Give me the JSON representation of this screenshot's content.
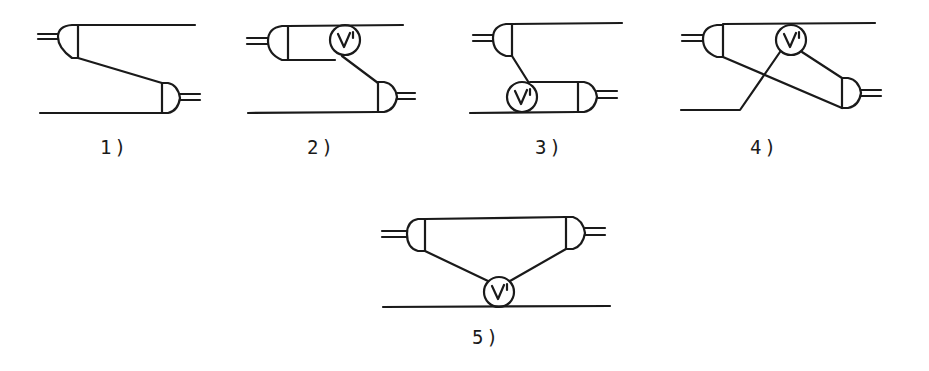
{
  "diagrams": [
    {
      "id": 1,
      "label": "1)",
      "has_voltmeter": false
    },
    {
      "id": 2,
      "label": "2)",
      "has_voltmeter": true,
      "voltmeter_label": "V'"
    },
    {
      "id": 3,
      "label": "3)",
      "has_voltmeter": true,
      "voltmeter_label": "V'"
    },
    {
      "id": 4,
      "label": "4)",
      "has_voltmeter": true,
      "voltmeter_label": "V'"
    },
    {
      "id": 5,
      "label": "5)",
      "has_voltmeter": true,
      "voltmeter_label": "V'"
    }
  ],
  "colors": {
    "ink": "#1a1a1a",
    "background": "#ffffff"
  }
}
